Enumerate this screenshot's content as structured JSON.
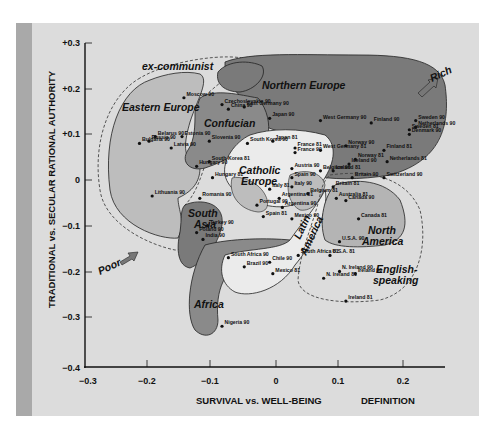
{
  "chart_data": {
    "type": "scatter",
    "title": "",
    "xlabel": "SURVIVAL vs. WELL-BEING",
    "ylabel": "TRADITIONAL vs. SECULAR RATIONAL AUTHORITY",
    "footer_label": "DEFINITION",
    "xlim": [
      -0.3,
      0.25
    ],
    "ylim": [
      -0.4,
      0.3
    ],
    "x_ticks": [
      "−0.3",
      "−0.2",
      "−0.1",
      "0",
      "0.1",
      "0.2"
    ],
    "y_ticks": [
      "+0.3",
      "+0.2",
      "+0.1",
      "0",
      "−0.1",
      "−0.2",
      "−0.3",
      "−0.4"
    ],
    "grid": false,
    "annotations": [
      "Rich",
      "Poor"
    ],
    "regions": [
      {
        "name": "ex-communist",
        "style": "dashed outline"
      },
      {
        "name": "Eastern Europe",
        "shade": "light"
      },
      {
        "name": "Confucian",
        "shade": "dark"
      },
      {
        "name": "Northern Europe",
        "shade": "dark"
      },
      {
        "name": "Catholic Europe",
        "shade": "light"
      },
      {
        "name": "South Asia",
        "shade": "dark"
      },
      {
        "name": "Latin America",
        "shade": "light"
      },
      {
        "name": "Africa",
        "shade": "dark"
      },
      {
        "name": "North America",
        "shade": "medium"
      },
      {
        "name": "English-speaking",
        "style": "dashed outline"
      }
    ],
    "points": [
      {
        "label": "Moscow 90",
        "x": -0.145,
        "y": 0.18
      },
      {
        "label": "Czechoslovakia 90",
        "x": -0.085,
        "y": 0.165
      },
      {
        "label": "East Germany 90",
        "x": -0.05,
        "y": 0.16
      },
      {
        "label": "China 90",
        "x": -0.075,
        "y": 0.155
      },
      {
        "label": "Japan 90",
        "x": -0.01,
        "y": 0.135
      },
      {
        "label": "Japan 81",
        "x": -0.005,
        "y": 0.085
      },
      {
        "label": "South Korea 90",
        "x": -0.045,
        "y": 0.08
      },
      {
        "label": "South Korea 81",
        "x": -0.105,
        "y": 0.04
      },
      {
        "label": "Belarus 90",
        "x": -0.19,
        "y": 0.095
      },
      {
        "label": "Russia 90",
        "x": -0.2,
        "y": 0.085
      },
      {
        "label": "Bulgaria 90",
        "x": -0.215,
        "y": 0.08
      },
      {
        "label": "Estonia 90",
        "x": -0.148,
        "y": 0.095
      },
      {
        "label": "Latvia 90",
        "x": -0.165,
        "y": 0.07
      },
      {
        "label": "Slovenia 90",
        "x": -0.105,
        "y": 0.085
      },
      {
        "label": "Hungary 90",
        "x": -0.125,
        "y": 0.03
      },
      {
        "label": "Hungary 81",
        "x": -0.1,
        "y": 0.005
      },
      {
        "label": "Romania 90",
        "x": -0.12,
        "y": -0.04
      },
      {
        "label": "Lithuania 90",
        "x": -0.195,
        "y": -0.035
      },
      {
        "label": "Poland 90",
        "x": -0.125,
        "y": -0.115
      },
      {
        "label": "Turkey 90",
        "x": -0.108,
        "y": -0.1
      },
      {
        "label": "India 90",
        "x": -0.115,
        "y": -0.13
      },
      {
        "label": "West Germany 90",
        "x": 0.07,
        "y": 0.13
      },
      {
        "label": "West Germany 81",
        "x": 0.07,
        "y": 0.065
      },
      {
        "label": "France 81",
        "x": 0.03,
        "y": 0.07
      },
      {
        "label": "France 90",
        "x": 0.03,
        "y": 0.06
      },
      {
        "label": "Austria 90",
        "x": 0.025,
        "y": 0.025
      },
      {
        "label": "Belgium 90",
        "x": 0.07,
        "y": 0.02
      },
      {
        "label": "Belgium 81",
        "x": 0.05,
        "y": -0.03
      },
      {
        "label": "Spain 90",
        "x": 0.025,
        "y": 0.005
      },
      {
        "label": "Spain 81",
        "x": -0.02,
        "y": -0.08
      },
      {
        "label": "Italy 90",
        "x": 0.025,
        "y": -0.015
      },
      {
        "label": "Italy 81",
        "x": -0.01,
        "y": -0.02
      },
      {
        "label": "Portugal 90",
        "x": -0.03,
        "y": -0.055
      },
      {
        "label": "Argentina 81",
        "x": 0.005,
        "y": -0.04
      },
      {
        "label": "Argentina 90",
        "x": 0.01,
        "y": -0.06
      },
      {
        "label": "Mexico 90",
        "x": 0.025,
        "y": -0.085
      },
      {
        "label": "Mexico 81",
        "x": -0.005,
        "y": -0.205
      },
      {
        "label": "Chile 90",
        "x": -0.01,
        "y": -0.18
      },
      {
        "label": "Brazil 90",
        "x": -0.05,
        "y": -0.19
      },
      {
        "label": "South Africa 81",
        "x": 0.035,
        "y": -0.165
      },
      {
        "label": "South Africa 90",
        "x": -0.075,
        "y": -0.17
      },
      {
        "label": "Nigeria 90",
        "x": -0.085,
        "y": -0.32
      },
      {
        "label": "Sweden 90",
        "x": 0.22,
        "y": 0.13
      },
      {
        "label": "Sweden 81",
        "x": 0.21,
        "y": 0.11
      },
      {
        "label": "Netherlands 90",
        "x": 0.22,
        "y": 0.115
      },
      {
        "label": "Denmark 90",
        "x": 0.21,
        "y": 0.1
      },
      {
        "label": "Finland 90",
        "x": 0.15,
        "y": 0.125
      },
      {
        "label": "Finland 81",
        "x": 0.17,
        "y": 0.065
      },
      {
        "label": "Norway 90",
        "x": 0.11,
        "y": 0.075
      },
      {
        "label": "Norway 81",
        "x": 0.125,
        "y": 0.045
      },
      {
        "label": "Netherlands 81",
        "x": 0.175,
        "y": 0.04
      },
      {
        "label": "Iceland 90",
        "x": 0.115,
        "y": 0.035
      },
      {
        "label": "Iceland 81",
        "x": 0.09,
        "y": 0.02
      },
      {
        "label": "Switzerland 90",
        "x": 0.17,
        "y": 0.005
      },
      {
        "label": "Britain 90",
        "x": 0.12,
        "y": 0.005
      },
      {
        "label": "Britain 81",
        "x": 0.09,
        "y": -0.015
      },
      {
        "label": "Australia 81",
        "x": 0.095,
        "y": -0.04
      },
      {
        "label": "Canada 90",
        "x": 0.11,
        "y": -0.045
      },
      {
        "label": "Canada 81",
        "x": 0.13,
        "y": -0.085
      },
      {
        "label": "U.S.A. 90",
        "x": 0.1,
        "y": -0.135
      },
      {
        "label": "U.S.A. 81",
        "x": 0.085,
        "y": -0.165
      },
      {
        "label": "N. Ireland 81",
        "x": 0.075,
        "y": -0.215
      },
      {
        "label": "N. Ireland 90",
        "x": 0.1,
        "y": -0.2
      },
      {
        "label": "Ireland 90",
        "x": 0.125,
        "y": -0.205
      },
      {
        "label": "Ireland 81",
        "x": 0.11,
        "y": -0.265
      }
    ]
  },
  "labels": {
    "ylabel": "TRADITIONAL vs. SECULAR RATIONAL AUTHORITY",
    "xlabel": "SURVIVAL vs. WELL-BEING",
    "definition": "DEFINITION",
    "rich": "Rich",
    "poor": "Poor",
    "ex_communist": "ex-communist",
    "eastern_europe": "Eastern Europe",
    "confucian": "Confucian",
    "northern_europe": "Northern Europe",
    "catholic_1": "Catholic",
    "catholic_2": "Europe",
    "south_asia_1": "South",
    "south_asia_2": "Asia",
    "latin_1": "Latin",
    "latin_2": "America",
    "africa": "Africa",
    "north_america_1": "North",
    "north_america_2": "America",
    "english_1": "English-",
    "english_2": "speaking",
    "x_ticks": [
      "−0.3",
      "−0.2",
      "−0.1",
      "0",
      "0.1",
      "0.2"
    ],
    "y_ticks": [
      "+0.3",
      "+0.2",
      "+0.1",
      "0",
      "−0.1",
      "−0.2",
      "−0.3",
      "−0.4"
    ]
  },
  "colors": {
    "panel": "#dcdcdc",
    "stripe": "#a9a9a9",
    "light_region": "#bdbdbd",
    "dark_region": "#7a7a7a",
    "medium_region": "#b4b4b4",
    "white_region": "#ebebeb"
  }
}
